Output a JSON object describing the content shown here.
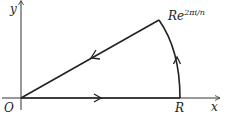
{
  "diagram": {
    "axes": {
      "x_label": "x",
      "y_label": "y",
      "origin_label": "O"
    },
    "points": {
      "R_label": "R",
      "corner_label_base": "Re",
      "corner_label_exponent": "2πi/n"
    },
    "contour": {
      "segments": [
        "O → R (along x-axis)",
        "arc R → Re^{2πi/n}",
        "Re^{2πi/n} → O"
      ],
      "color": "#222222"
    }
  }
}
